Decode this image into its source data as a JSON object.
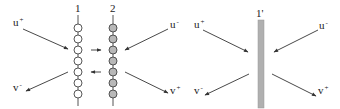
{
  "left_panel": {
    "chain_labels": [
      "1",
      "2"
    ],
    "labels": {
      "u_plus": {
        "base": "u",
        "sup": "+"
      },
      "v_minus": {
        "base": "v",
        "sup": "-"
      },
      "u_minus": {
        "base": "u",
        "sup": "-"
      },
      "v_plus": {
        "base": "v",
        "sup": "+"
      }
    },
    "beads_per_chain": 7,
    "chain1_fill": "#ffffff",
    "chain2_fill": "#b8b8b8"
  },
  "right_panel": {
    "bar_label": "1'",
    "bar_color": "#b0b0b0",
    "labels": {
      "u_plus": {
        "base": "u",
        "sup": "+"
      },
      "u_minus": {
        "base": "u",
        "sup": "-"
      },
      "v_minus": {
        "base": "v",
        "sup": "-"
      },
      "v_plus": {
        "base": "v",
        "sup": "+"
      }
    }
  }
}
